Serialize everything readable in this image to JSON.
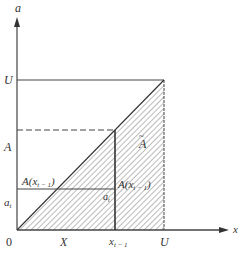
{
  "figure": {
    "axes": {
      "y_label": "a",
      "x_label": "x",
      "origin_label": "0"
    },
    "y_ticks": {
      "U": "U",
      "A": "A",
      "a_t": "a",
      "a_t_sub": "t"
    },
    "x_ticks": {
      "X": "X",
      "x_t1": "x",
      "x_t1_sub": "t − 1",
      "U": "U"
    },
    "annotations": {
      "A_left": "A(x",
      "A_left_sub": "t − 1",
      "A_left_close": ")",
      "A_right": "A(x",
      "A_right_sub": "t − 1",
      "A_right_close": ")",
      "a_t_inner": "a",
      "a_t_inner_sub": "t",
      "A_bar": "A",
      "A_bar_accent": "~"
    },
    "colors": {
      "line": "#444444",
      "hatch": "#777777",
      "background": "#ffffff"
    }
  }
}
